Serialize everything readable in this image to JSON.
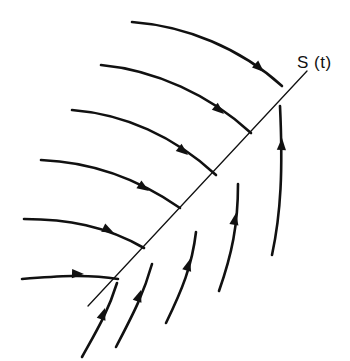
{
  "figure": {
    "title": "",
    "background_color": "#ffffff",
    "stroke_color": "#111111",
    "width": 350,
    "height": 361,
    "labels": [
      {
        "id": "shock-line-label",
        "text": "S (t)",
        "x": 297,
        "y": 68,
        "font_size": 17
      }
    ],
    "shock_line": {
      "name": "S(t)",
      "label": "S (t)",
      "x1": 88,
      "y1": 306,
      "x2": 307,
      "y2": 71,
      "stroke_width": 1.3
    },
    "wavefront_arcs": [
      {
        "id": "arc-1",
        "path": "M 132,22 C 186,26 240,48 282,86",
        "stroke_width": 2.6,
        "arrow": {
          "x": 264,
          "y": 72,
          "angle": 42
        }
      },
      {
        "id": "arc-2",
        "path": "M 101,65 C 155,70 210,95 251,133",
        "stroke_width": 2.6,
        "arrow": {
          "x": 224,
          "y": 114,
          "angle": 40
        }
      },
      {
        "id": "arc-3",
        "path": "M 72,110 C 124,114 174,136 216,175",
        "stroke_width": 2.6,
        "arrow": {
          "x": 188,
          "y": 155,
          "angle": 39
        }
      },
      {
        "id": "arc-4",
        "path": "M 41,160 C 92,162 137,178 180,208",
        "stroke_width": 2.6,
        "arrow": {
          "x": 149,
          "y": 191,
          "angle": 33
        }
      },
      {
        "id": "arc-5",
        "path": "M 24,219 C 67,219 106,226 144,248",
        "stroke_width": 2.6,
        "arrow": {
          "x": 114,
          "y": 233,
          "angle": 26
        }
      },
      {
        "id": "arc-6",
        "path": "M 22,279 C 58,276 88,274 118,279",
        "stroke_width": 2.6,
        "arrow": {
          "x": 84,
          "y": 274,
          "angle": 2
        }
      }
    ],
    "characteristic_curves": [
      {
        "id": "char-curve-1",
        "path": "M 82,357 C 97,330 108,312 117,283",
        "stroke_width": 2.6,
        "arrow": {
          "x": 105,
          "y": 308,
          "angle": -71
        }
      },
      {
        "id": "char-curve-2",
        "path": "M 116,347 C 132,316 143,296 152,264",
        "stroke_width": 2.6,
        "arrow": {
          "x": 141,
          "y": 290,
          "angle": -71
        }
      },
      {
        "id": "char-curve-3",
        "path": "M 166,323 C 182,290 192,266 196,232",
        "stroke_width": 2.6,
        "arrow": {
          "x": 190,
          "y": 259,
          "angle": -74
        }
      },
      {
        "id": "char-curve-4",
        "path": "M 219,291 C 232,254 238,225 238,184",
        "stroke_width": 2.6,
        "arrow": {
          "x": 236,
          "y": 213,
          "angle": -80
        }
      },
      {
        "id": "char-curve-5",
        "path": "M 272,255 C 281,213 283,170 280,106",
        "stroke_width": 2.6,
        "arrow": {
          "x": 282,
          "y": 138,
          "angle": -87
        }
      }
    ]
  }
}
